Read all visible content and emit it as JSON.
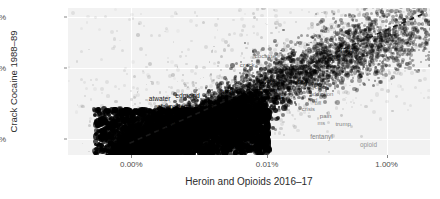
{
  "chart_data": {
    "type": "scatter",
    "title": "",
    "xlabel": "Heroin and Opioids 2016–17",
    "ylabel": "Crack Cocaine 1988–89",
    "xticks": [
      "0.00%",
      "0.01%",
      "1.00%"
    ],
    "xtick_pos": [
      0.175,
      0.55,
      0.88
    ],
    "yticks": [
      "10.0%",
      "0.1%",
      "0.0%"
    ],
    "ytick_pos": [
      0.06,
      0.41,
      0.89
    ],
    "grid": true,
    "legend": "none",
    "point_color": "#1a1a1a",
    "panel_color": "#f2f2f2",
    "fit_line": {
      "style": "dashed",
      "color": "#1a1a1a",
      "x0": 0.17,
      "y0": 0.92,
      "x1": 0.99,
      "y1": 0.03
    },
    "annotations": [
      {
        "text": "10.0%",
        "role": "y-axis-tick"
      },
      {
        "text": "0.1%",
        "role": "y-axis-tick"
      },
      {
        "text": "0.0%",
        "role": "y-axis-tick"
      }
    ],
    "word_labels": [
      {
        "text": "cocaine",
        "x": 0.545,
        "y": 0.325,
        "size": 6.2,
        "alpha": 0.55
      },
      {
        "text": "crack",
        "x": 0.495,
        "y": 0.385,
        "size": 6.2,
        "alpha": 0.6
      },
      {
        "text": "drugs",
        "x": 0.765,
        "y": 0.285,
        "size": 6.4,
        "alpha": 0.62
      },
      {
        "text": "drug",
        "x": 0.735,
        "y": 0.33,
        "size": 6.0,
        "alpha": 0.55
      },
      {
        "text": "bay",
        "x": 0.648,
        "y": 0.5,
        "size": 6.6,
        "alpha": 0.88
      },
      {
        "text": "bayer",
        "x": 0.672,
        "y": 0.52,
        "size": 5.6,
        "alpha": 0.52
      },
      {
        "text": "crime",
        "x": 0.7,
        "y": 0.545,
        "size": 5.6,
        "alpha": 0.48
      },
      {
        "text": "addiction",
        "x": 0.7,
        "y": 0.585,
        "size": 6.0,
        "alpha": 0.52
      },
      {
        "text": "hud",
        "x": 0.676,
        "y": 0.63,
        "size": 5.6,
        "alpha": 0.46
      },
      {
        "text": "bill",
        "x": 0.69,
        "y": 0.655,
        "size": 5.6,
        "alpha": 0.46
      },
      {
        "text": "crisis",
        "x": 0.664,
        "y": 0.695,
        "size": 5.8,
        "alpha": 0.52
      },
      {
        "text": "pain",
        "x": 0.712,
        "y": 0.735,
        "size": 6.2,
        "alpha": 0.56
      },
      {
        "text": "ms",
        "x": 0.7,
        "y": 0.79,
        "size": 5.8,
        "alpha": 0.48
      },
      {
        "text": "trump",
        "x": 0.76,
        "y": 0.79,
        "size": 6.0,
        "alpha": 0.5
      },
      {
        "text": "fentanyl",
        "x": 0.7,
        "y": 0.88,
        "size": 6.4,
        "alpha": 0.48
      },
      {
        "text": "opioid",
        "x": 0.83,
        "y": 0.935,
        "size": 6.4,
        "alpha": 0.42
      },
      {
        "text": "dea",
        "x": 0.54,
        "y": 0.5,
        "size": 5.8,
        "alpha": 0.7
      },
      {
        "text": "death",
        "x": 0.572,
        "y": 0.505,
        "size": 5.8,
        "alpha": 0.7
      },
      {
        "text": "heroin",
        "x": 0.556,
        "y": 0.565,
        "size": 5.8,
        "alpha": 0.75
      },
      {
        "text": "abuse",
        "x": 0.52,
        "y": 0.62,
        "size": 5.8,
        "alpha": 0.72
      },
      {
        "text": "boxer",
        "x": 0.525,
        "y": 0.8,
        "size": 6.2,
        "alpha": 0.88
      },
      {
        "text": "treasury",
        "x": 0.47,
        "y": 0.845,
        "size": 6.0,
        "alpha": 0.85
      },
      {
        "text": "afghanistan",
        "x": 0.47,
        "y": 0.885,
        "size": 6.4,
        "alpha": 0.9
      },
      {
        "text": "abstract",
        "x": 0.462,
        "y": 0.91,
        "size": 6.2,
        "alpha": 0.9
      },
      {
        "text": "analgesics",
        "x": 0.48,
        "y": 0.945,
        "size": 6.8,
        "alpha": 0.92
      },
      {
        "text": "atwater",
        "x": 0.253,
        "y": 0.62,
        "size": 6.6,
        "alpha": 0.9
      },
      {
        "text": "edmond",
        "x": 0.33,
        "y": 0.6,
        "size": 6.8,
        "alpha": 0.9
      },
      {
        "text": "hud",
        "x": 0.437,
        "y": 0.57,
        "size": 6.4,
        "alpha": 0.88
      },
      {
        "text": "crack",
        "x": 0.52,
        "y": 0.6,
        "size": 6.2,
        "alpha": 0.8
      },
      {
        "text": "atlanta",
        "x": 0.566,
        "y": 0.605,
        "size": 6.0,
        "alpha": 0.78
      },
      {
        "text": "afc",
        "x": 0.258,
        "y": 0.67,
        "size": 6.4,
        "alpha": 0.9
      },
      {
        "text": "noriega",
        "x": 0.31,
        "y": 0.672,
        "size": 6.6,
        "alpha": 0.92
      },
      {
        "text": "anheuser",
        "x": 0.436,
        "y": 0.68,
        "size": 6.6,
        "alpha": 0.9
      },
      {
        "text": "soerbogan",
        "x": 0.276,
        "y": 0.745,
        "size": 6.2,
        "alpha": 0.88
      },
      {
        "text": "albuquerque",
        "x": 0.29,
        "y": 0.785,
        "size": 6.0,
        "alpha": 0.85
      },
      {
        "text": "hud",
        "x": 0.258,
        "y": 0.83,
        "size": 5.8,
        "alpha": 0.8
      }
    ]
  }
}
